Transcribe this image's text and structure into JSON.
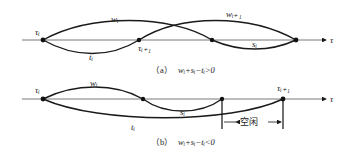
{
  "panel_a": {
    "caption_tag": "（a）",
    "caption_expr": "wᵢ+sᵢ−tᵢ>0",
    "axis_label": "τ",
    "labels": {
      "tau_i": "τᵢ",
      "tau_i1": "τᵢ₊₁",
      "w_i": "wᵢ",
      "w_i1": "wᵢ₊₁",
      "t_i": "tᵢ",
      "s_i": "sᵢ"
    }
  },
  "panel_b": {
    "caption_tag": "（b）",
    "caption_expr": "wᵢ+sᵢ−tᵢ<0",
    "axis_label": "τ",
    "labels": {
      "tau_i": "τᵢ",
      "tau_i1": "τᵢ₊₁",
      "w_i": "wᵢ",
      "t_i": "tᵢ",
      "s_i": "sᵢ",
      "idle": "空闲"
    }
  },
  "colors": {
    "stroke": "#1a1a1a",
    "axis": "#555555",
    "background": "#ffffff"
  }
}
